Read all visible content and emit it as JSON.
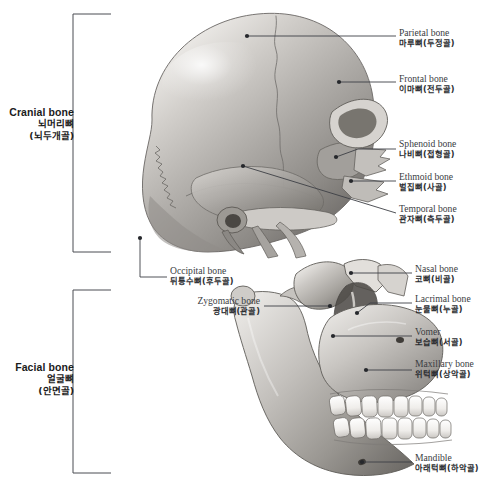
{
  "figure": {
    "background_color": "#ffffff",
    "line_color": "#3d4045",
    "bone_light": "#f2f0ee",
    "bone_mid": "#b9b6b2",
    "bone_dark": "#6e6b68"
  },
  "groups": [
    {
      "id": "cranial",
      "en": "Cranial bone",
      "ko1": "뇌머리뼈",
      "ko2": "(뇌두개골)",
      "bracket": {
        "x": 73,
        "top": 14,
        "bottom": 252,
        "arm": 38
      }
    },
    {
      "id": "facial",
      "en": "Facial bone",
      "ko1": "얼굴뼈",
      "ko2": "(안면골)",
      "bracket": {
        "x": 73,
        "top": 290,
        "bottom": 473,
        "arm": 38
      }
    }
  ],
  "callouts": [
    {
      "id": "parietal",
      "en": "Parietal bone",
      "ko": "마루뼈(두정골)",
      "side": "right",
      "text_x": 399,
      "text_y": 28,
      "line": "M396,36 L247,36",
      "dot": [
        247,
        36
      ]
    },
    {
      "id": "frontal",
      "en": "Frontal bone",
      "ko": "이마뼈(전두골)",
      "side": "right",
      "text_x": 399,
      "text_y": 74,
      "line": "M396,82 L339,82",
      "dot": [
        339,
        82
      ]
    },
    {
      "id": "sphenoid",
      "en": "Sphenoid bone",
      "ko": "나비뼈(접형골)",
      "side": "right",
      "text_x": 399,
      "text_y": 139,
      "line": "M396,149 L358,149 L336,157",
      "dot": [
        336,
        157
      ]
    },
    {
      "id": "ethmoid",
      "en": "Ethmoid bone",
      "ko": "벌집뼈(사골)",
      "side": "right",
      "text_x": 399,
      "text_y": 172,
      "line": "M396,181 L351,181",
      "dot": [
        351,
        181
      ]
    },
    {
      "id": "temporal",
      "en": "Temporal bone",
      "ko": "관자뼈(측두골)",
      "side": "right",
      "text_x": 399,
      "text_y": 204,
      "line": "M396,213 L243,166",
      "dot": [
        243,
        166
      ]
    },
    {
      "id": "occipital",
      "en": "Occipital bone",
      "ko": "뒤통수뼈(후두골)",
      "side": "right",
      "text_x": 170,
      "text_y": 266,
      "line": "M167,277 L140,277 L140,238",
      "dot": [
        140,
        238
      ]
    },
    {
      "id": "zygomatic",
      "en": "Zygomatic bone",
      "ko": "광대뼈(관골)",
      "side": "left",
      "text_x": 110,
      "text_y": 296,
      "line": "M264,306 L330,306",
      "dot": [
        330,
        306
      ]
    },
    {
      "id": "nasal",
      "en": "Nasal bone",
      "ko": "코뼈(비골)",
      "side": "right",
      "text_x": 415,
      "text_y": 264,
      "line": "M412,273 L351,273",
      "dot": [
        351,
        273
      ]
    },
    {
      "id": "lacrimal",
      "en": "Lacrimal bone",
      "ko": "눈물뼈(누골)",
      "side": "right",
      "text_x": 415,
      "text_y": 294,
      "line": "M412,303 L370,303 L357,313",
      "dot": [
        357,
        313
      ]
    },
    {
      "id": "vomer",
      "en": "Vomer",
      "ko": "보습뼈(서골)",
      "side": "right",
      "text_x": 415,
      "text_y": 327,
      "line": "M412,336 L333,336",
      "dot": [
        333,
        336
      ]
    },
    {
      "id": "maxillary",
      "en": "Maxillary bone",
      "ko": "위턱뼈(상악골)",
      "side": "right",
      "text_x": 415,
      "text_y": 359,
      "line": "M412,370 L366,370",
      "dot": [
        366,
        370
      ]
    },
    {
      "id": "mandible",
      "en": "Mandible",
      "ko": "아래턱뼈(하악골)",
      "side": "right",
      "text_x": 415,
      "text_y": 453,
      "line": "M412,462 L362,462",
      "dot": [
        362,
        462
      ]
    }
  ]
}
